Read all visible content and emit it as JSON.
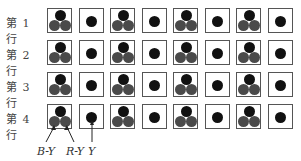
{
  "rows": [
    {
      "label": "第 1 行",
      "cells": [
        "triple",
        "single",
        "triple",
        "single",
        "triple",
        "single",
        "triple",
        "single"
      ]
    },
    {
      "label": "第 2 行",
      "cells": [
        "triple",
        "single",
        "triple",
        "single",
        "triple",
        "single",
        "triple",
        "single"
      ]
    },
    {
      "label": "第 3 行",
      "cells": [
        "triple",
        "single",
        "triple",
        "single",
        "triple",
        "single",
        "triple",
        "single"
      ]
    },
    {
      "label": "第 4 行",
      "cells": [
        "triple",
        "single",
        "triple",
        "single",
        "triple",
        "single",
        "triple",
        "single"
      ]
    }
  ],
  "annotations": {
    "b_y": "B-Y",
    "r_y": "R-Y",
    "y": "Y"
  },
  "colors": {
    "luma_dot": "#111111",
    "chroma_dot": "#4a4a4a",
    "border": "#555555"
  }
}
